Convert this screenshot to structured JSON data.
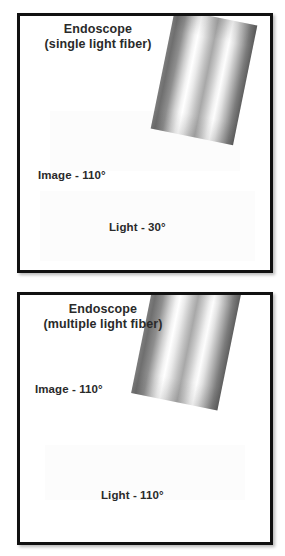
{
  "figure": {
    "name": "endoscope-light-distribution-figure",
    "background_color": "#ffffff",
    "border_color": "#111111",
    "panel_count": 2
  },
  "panels": [
    {
      "id": "panel-1",
      "title_line_1": "Endoscope",
      "title_line_2": "(single light fiber)",
      "image_label": "Image - 110°",
      "light_label": "Light - 30°",
      "image_angle_degrees": 110,
      "light_angle_degrees": 30,
      "fiber_type": "single light fiber",
      "graphic_name": "endoscope-tube-gradient"
    },
    {
      "id": "panel-2",
      "title_line_1": "Endoscope",
      "title_line_2": "(multiple light fiber)",
      "image_label": "Image - 110°",
      "light_label": "Light - 110°",
      "image_angle_degrees": 110,
      "light_angle_degrees": 110,
      "fiber_type": "multiple light fiber",
      "graphic_name": "endoscope-tube-gradient"
    }
  ],
  "colors": {
    "text": "#2a2a2a",
    "panel_border": "#111111",
    "page_background": "#ffffff",
    "tube_dark": "#6f6f6f",
    "tube_mid": "#a8a8a8",
    "tube_highlight": "#ffffff"
  }
}
